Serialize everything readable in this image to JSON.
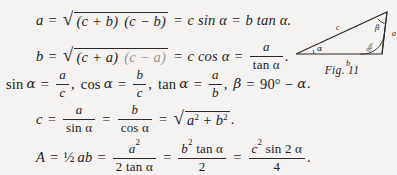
{
  "page": {
    "background_color": "#f4f3f1",
    "ink_color": "#24211f"
  },
  "equations": [
    {
      "id": "eq-a",
      "text": "a = √((c + b) (c − b)) = c sin α = b tan α.",
      "lhs": "a",
      "parts": {
        "radicand_left": "(c + b)",
        "radicand_right": "(c − b)",
        "rhs2": "c sin α",
        "rhs3": "b tan α."
      }
    },
    {
      "id": "eq-b",
      "text": "b = √((c + a) (c − a)) = c cos α = a / tan α.",
      "lhs": "b",
      "parts": {
        "radicand_left": "(c + a)",
        "radicand_right": "(c − a)",
        "rhs2": "c cos α",
        "frac_num": "a",
        "frac_den": "tan α"
      }
    },
    {
      "id": "eq-ratios",
      "text": "sin α = a/c, cos α = b/c, tan α = a/b, β = 90° − α.",
      "parts": {
        "sin_label": "sin",
        "sin_num": "a",
        "sin_den": "c",
        "cos_label": "cos",
        "cos_num": "b",
        "cos_den": "c",
        "tan_label": "tan",
        "tan_num": "a",
        "tan_den": "b",
        "beta": "β",
        "beta_value": "90°",
        "beta_minus": "−",
        "beta_alpha": "α."
      }
    },
    {
      "id": "eq-c",
      "text": "c = a / sin α = b / cos α = √(a² + b²).",
      "lhs": "c",
      "parts": {
        "f1_num": "a",
        "f1_den": "sin α",
        "f2_num": "b",
        "f2_den": "cos α",
        "rad_a": "a",
        "rad_b": "b",
        "rad_plus": "+",
        "rad_end": "."
      }
    },
    {
      "id": "eq-area",
      "text": "A = ½ ab = a² / (2 tan α) = b² tan α / 2 = c² sin 2 α / 4.",
      "lhs": "A",
      "parts": {
        "half": "½",
        "ab": "ab",
        "f1_num": "a",
        "f1_den": "2 tan α",
        "f2_num": "b",
        "f2_den": "2",
        "f2_num_tail": "tan α",
        "f3_num": "c",
        "f3_num_tail": "sin 2 α",
        "f3_den": "4",
        "end": "."
      }
    }
  ],
  "figure": {
    "caption": "Fig. 11",
    "labels": {
      "hypotenuse": "c",
      "base": "b",
      "vertical": "a",
      "angle_left": "α",
      "angle_top_right": "β",
      "angle_right": "90°"
    }
  },
  "symbols": {
    "alpha": "α",
    "beta": "β",
    "radical": "√",
    "equals": "=",
    "plus": "+",
    "minus": "−",
    "squared": "2"
  }
}
